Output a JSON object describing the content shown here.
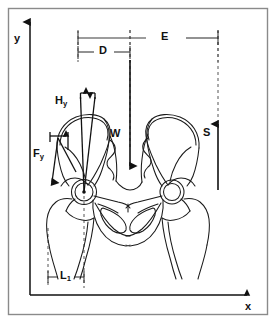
{
  "figure": {
    "type": "biomechanical-diagram",
    "background_color": "#ffffff",
    "frame_color": "#8a8a8a",
    "line_color": "#111111",
    "bone_outline_color": "#1a1a1a",
    "dashed_color": "#555555"
  },
  "axes": {
    "y_label": "y",
    "x_label": "x",
    "origin_px": [
      30,
      295
    ],
    "y_tip_px": [
      30,
      18
    ],
    "x_tip_px": [
      252,
      295
    ]
  },
  "dimensions": [
    {
      "name": "E",
      "label": "E",
      "orientation": "horizontal",
      "from_px": 78,
      "to_px": 218,
      "y_px": 38
    },
    {
      "name": "D",
      "label": "D",
      "orientation": "horizontal",
      "from_px": 78,
      "to_px": 130,
      "y_px": 52
    },
    {
      "name": "L1",
      "label": "L",
      "subscript": "1",
      "orientation": "horizontal",
      "from_px": 48,
      "to_px": 84,
      "y_px": 277
    }
  ],
  "vectors": [
    {
      "name": "Hy",
      "label": "H",
      "subscript": "y",
      "label_px": [
        57,
        96
      ],
      "direction": "horizontal-double-arrow",
      "description": "hip joint reaction horizontal component at acetabulum"
    },
    {
      "name": "Fy",
      "label": "F",
      "subscript": "y",
      "label_px": [
        35,
        150
      ],
      "direction": "down-left",
      "description": "abductor muscle force vector"
    },
    {
      "name": "W",
      "label": "W",
      "label_px": [
        113,
        134
      ],
      "direction": "down",
      "description": "body weight acting downward"
    },
    {
      "name": "S",
      "label": "S",
      "label_px": [
        203,
        133
      ],
      "direction": "up",
      "description": "support reaction acting upward"
    }
  ],
  "dashed_guides": [
    {
      "name": "D-left-guide",
      "x_px": 78,
      "y1_px": 30,
      "y2_px": 62
    },
    {
      "name": "D-right-guide",
      "x_px": 130,
      "y1_px": 30,
      "y2_px": 62
    },
    {
      "name": "E-right-guide",
      "x_px": 218,
      "y1_px": 30,
      "y2_px": 62
    },
    {
      "name": "W-line",
      "x_px": 130,
      "y1_px": 30,
      "y2_px": 172
    },
    {
      "name": "S-line",
      "x_px": 218,
      "y1_px": 30,
      "y2_px": 126
    },
    {
      "name": "L1-left-guide",
      "x_px": 48,
      "y1_px": 228,
      "y2_px": 288
    },
    {
      "name": "L1-right-guide",
      "x_px": 84,
      "y1_px": 196,
      "y2_px": 288
    }
  ],
  "anatomy": {
    "left_femoral_head_center_px": [
      84,
      192
    ],
    "left_femoral_head_radius_px": 11,
    "right_femoral_head_center_px": [
      172,
      192
    ],
    "right_femoral_head_radius_px": 10,
    "parts": [
      "left-ilium",
      "right-ilium",
      "sacrum",
      "left-pubis",
      "right-pubis",
      "left-obturator-foramen",
      "right-obturator-foramen",
      "left-femur",
      "right-femur",
      "left-femoral-head",
      "right-femoral-head"
    ]
  }
}
